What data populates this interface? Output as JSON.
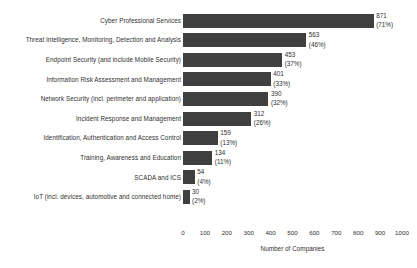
{
  "chart_data": {
    "type": "bar",
    "orientation": "horizontal",
    "title": "",
    "xlabel": "Number of Companies",
    "ylabel": "",
    "xlim": [
      0,
      1000
    ],
    "xticks": [
      0,
      100,
      200,
      300,
      400,
      500,
      600,
      700,
      800,
      900,
      1000
    ],
    "grid": false,
    "legend": "none",
    "bar_color": "#3f3f3f",
    "categories": [
      "Cyber Professional Services",
      "Threat Intelligence, Monitoring, Detection and Analysis",
      "Endpoint Security (and include Mobile Security)",
      "Information Risk Assessment and Management",
      "Network Security (incl. perimeter and application)",
      "Incident Response and Management",
      "Identification, Authentication and Access Control",
      "Training, Awareness and Education",
      "SCADA and ICS",
      "IoT (incl. devices, automotive and connected home)"
    ],
    "values": [
      871,
      563,
      453,
      401,
      390,
      312,
      159,
      134,
      54,
      30
    ],
    "percent_labels": [
      "(71%)",
      "(46%)",
      "(37%)",
      "(33%)",
      "(32%)",
      "(26%)",
      "(13%)",
      "(11%)",
      "(4%)",
      "(2%)"
    ],
    "value_labels": [
      "871",
      "563",
      "453",
      "401",
      "390",
      "312",
      "159",
      "134",
      "54",
      "30"
    ]
  }
}
